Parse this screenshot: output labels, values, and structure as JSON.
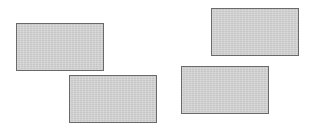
{
  "diagram": {
    "background": "#ffffff",
    "shape_style": {
      "fill": "#d4d4d4",
      "stroke": "#6a6a6a"
    },
    "rectangles": [
      {
        "id": "rect-1",
        "x": 16,
        "y": 23,
        "width": 88,
        "height": 48
      },
      {
        "id": "rect-2",
        "x": 69,
        "y": 75,
        "width": 88,
        "height": 48
      },
      {
        "id": "rect-3",
        "x": 211,
        "y": 8,
        "width": 88,
        "height": 48
      },
      {
        "id": "rect-4",
        "x": 181,
        "y": 66,
        "width": 88,
        "height": 48
      }
    ]
  }
}
